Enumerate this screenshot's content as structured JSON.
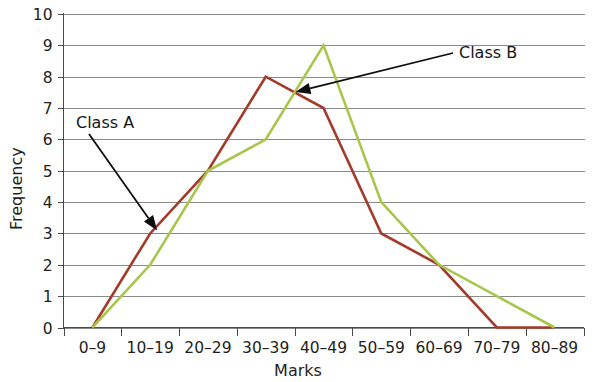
{
  "chart_data": {
    "type": "line",
    "title": "",
    "subtitle": "",
    "xlabel": "Marks",
    "ylabel": "Frequency",
    "categories": [
      "0–9",
      "10–19",
      "20–29",
      "30–39",
      "40–49",
      "50–59",
      "60–69",
      "70–79",
      "80–89"
    ],
    "ylim": [
      0,
      10
    ],
    "yticks": [
      "0",
      "1",
      "2",
      "3",
      "4",
      "5",
      "6",
      "7",
      "8",
      "9",
      "10"
    ],
    "ytick_values": [
      0,
      1,
      2,
      3,
      4,
      5,
      6,
      7,
      8,
      9,
      10
    ],
    "grid": true,
    "grid_axis": "y",
    "legend": "annotations",
    "legend_position": "inline-arrows",
    "series": [
      {
        "name": "Class A",
        "color": "#a33b2a",
        "values": [
          0,
          3,
          5,
          8,
          7,
          3,
          2,
          0,
          0
        ]
      },
      {
        "name": "Class B",
        "color": "#a9c64c",
        "values": [
          0,
          2,
          5,
          6,
          9,
          4,
          2,
          1,
          0
        ]
      }
    ],
    "annotations": [
      {
        "text": "Class A",
        "series": "Class A",
        "points_to_category": "10–19",
        "points_to_value": 3
      },
      {
        "text": "Class B",
        "series": "Class B",
        "points_to_category": "40–49",
        "points_to_value": 7
      }
    ]
  },
  "axes": {
    "y_title": "Frequency",
    "x_title": "Marks"
  },
  "colors": {
    "class_a": "#a33b2a",
    "class_b": "#a9c64c",
    "gridline": "#8a8a8a",
    "axis": "#4a4a4a",
    "text": "#231f20",
    "background": "#ffffff"
  }
}
